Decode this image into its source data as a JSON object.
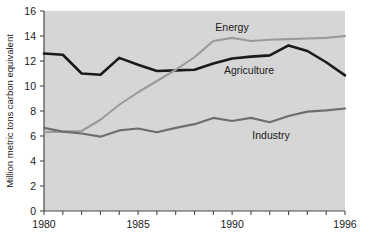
{
  "chart_data": {
    "type": "line",
    "title": "",
    "xlabel": "",
    "ylabel": "Million metric tons carbon equivalent",
    "xlim": [
      1980,
      1996
    ],
    "ylim": [
      0,
      16
    ],
    "grid": false,
    "legend_position": "inline-labels",
    "background_color": "#d6d6d6",
    "x": [
      1980,
      1981,
      1982,
      1983,
      1984,
      1985,
      1986,
      1987,
      1988,
      1989,
      1990,
      1991,
      1992,
      1993,
      1994,
      1995,
      1996
    ],
    "xticks": [
      1980,
      1981,
      1982,
      1983,
      1984,
      1985,
      1986,
      1987,
      1988,
      1989,
      1990,
      1991,
      1992,
      1993,
      1994,
      1995,
      1996
    ],
    "xtick_labels": [
      "1980",
      "",
      "",
      "",
      "",
      "1985",
      "",
      "",
      "",
      "",
      "1990",
      "",
      "",
      "",
      "",
      "",
      "1996"
    ],
    "yticks": [
      0,
      2,
      4,
      6,
      8,
      10,
      12,
      14,
      16
    ],
    "ytick_labels": [
      "0",
      "2",
      "4",
      "6",
      "8",
      "10",
      "12",
      "14",
      "16"
    ],
    "series": [
      {
        "name": "Agriculture",
        "color": "#1a1a1a",
        "stroke_width": 2.6,
        "label": "Agriculture",
        "values": [
          12.6,
          12.5,
          11.0,
          10.9,
          12.25,
          11.7,
          11.2,
          11.25,
          11.3,
          11.8,
          12.2,
          12.35,
          12.45,
          13.25,
          12.8,
          11.9,
          10.85
        ]
      },
      {
        "name": "Energy",
        "color": "#9a9a9a",
        "stroke_width": 2.1,
        "label": "Energy",
        "values": [
          6.3,
          6.35,
          6.4,
          7.3,
          8.5,
          9.5,
          10.4,
          11.3,
          12.3,
          13.6,
          13.85,
          13.6,
          13.7,
          13.75,
          13.8,
          13.85,
          14.0
        ]
      },
      {
        "name": "Industry",
        "color": "#6e6e6e",
        "stroke_width": 2.1,
        "label": "Industry",
        "values": [
          6.65,
          6.35,
          6.2,
          5.95,
          6.45,
          6.6,
          6.3,
          6.65,
          6.95,
          7.45,
          7.2,
          7.45,
          7.1,
          7.6,
          7.95,
          8.05,
          8.2
        ]
      }
    ],
    "annotations": [
      {
        "text": "Energy",
        "x_px": 232,
        "y_px": 31
      },
      {
        "text": "Agriculture",
        "x_px": 249,
        "y_px": 74
      },
      {
        "text": "Industry",
        "x_px": 271,
        "y_px": 139
      }
    ]
  }
}
